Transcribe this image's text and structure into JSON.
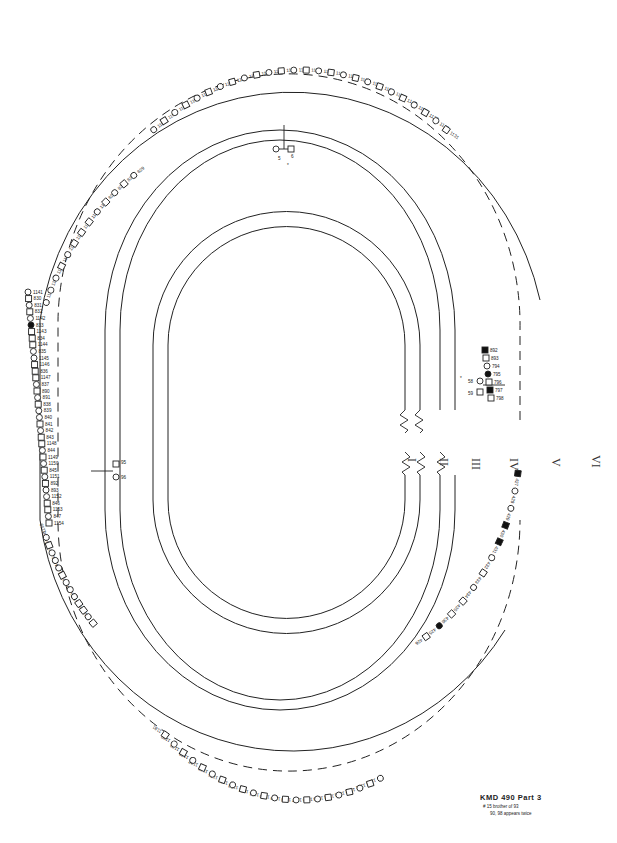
{
  "diagram": {
    "type": "circular-pedigree",
    "title": "KMD 490 Part 3",
    "notes": [
      "# 15 brother of 93",
      "90, 98 appears twice"
    ],
    "generation_labels": [
      "I",
      "II",
      "III",
      "IV",
      "V",
      "VI"
    ],
    "top_couple": {
      "ids": [
        "5",
        "6"
      ],
      "marker": "*"
    },
    "left_couple": {
      "ids": [
        "95",
        "96"
      ]
    },
    "right_couple": {
      "ids": [
        "58",
        "59"
      ],
      "marker": "*"
    },
    "left_side_individuals": [
      {
        "id": "1141",
        "shape": "circle"
      },
      {
        "id": "830",
        "shape": "square"
      },
      {
        "id": "831",
        "shape": "circle"
      },
      {
        "id": "832",
        "shape": "square"
      },
      {
        "id": "1142",
        "shape": "circle"
      },
      {
        "id": "833",
        "shape": "circle",
        "affected": true
      },
      {
        "id": "1143",
        "shape": "square"
      },
      {
        "id": "834",
        "shape": "square"
      },
      {
        "id": "1144",
        "shape": "square"
      },
      {
        "id": "835",
        "shape": "circle"
      },
      {
        "id": "1145",
        "shape": "circle"
      },
      {
        "id": "1146",
        "shape": "square"
      },
      {
        "id": "836",
        "shape": "square"
      },
      {
        "id": "1147",
        "shape": "square"
      },
      {
        "id": "837",
        "shape": "circle"
      },
      {
        "id": "890",
        "shape": "square"
      },
      {
        "id": "891",
        "shape": "circle"
      },
      {
        "id": "838",
        "shape": "square"
      },
      {
        "id": "839",
        "shape": "circle"
      },
      {
        "id": "840",
        "shape": "circle"
      },
      {
        "id": "841",
        "shape": "square"
      },
      {
        "id": "842",
        "shape": "circle"
      },
      {
        "id": "843",
        "shape": "square"
      },
      {
        "id": "1148",
        "shape": "square"
      },
      {
        "id": "844",
        "shape": "circle"
      },
      {
        "id": "1149",
        "shape": "square"
      },
      {
        "id": "1150",
        "shape": "circle"
      },
      {
        "id": "845",
        "shape": "square"
      },
      {
        "id": "1151",
        "shape": "circle"
      },
      {
        "id": "892",
        "shape": "square"
      },
      {
        "id": "893",
        "shape": "circle"
      },
      {
        "id": "1152",
        "shape": "circle"
      },
      {
        "id": "846",
        "shape": "square"
      },
      {
        "id": "1153",
        "shape": "square"
      },
      {
        "id": "847",
        "shape": "circle"
      },
      {
        "id": "1154",
        "shape": "square"
      }
    ],
    "upper_left_individuals": [
      {
        "id": "1132",
        "shape": "circle"
      },
      {
        "id": "1133",
        "shape": "circle"
      },
      {
        "id": "1134",
        "shape": "circle"
      },
      {
        "id": "1135",
        "shape": "square"
      },
      {
        "id": "1136",
        "shape": "circle"
      },
      {
        "id": "1137",
        "shape": "square"
      },
      {
        "id": "1138",
        "shape": "square"
      },
      {
        "id": "1139",
        "shape": "square"
      },
      {
        "id": "1140",
        "shape": "circle"
      },
      {
        "id": "826",
        "shape": "square"
      },
      {
        "id": "827",
        "shape": "circle"
      },
      {
        "id": "828",
        "shape": "square"
      },
      {
        "id": "829",
        "shape": "circle"
      }
    ],
    "lower_left_individuals": [
      {
        "id": "1155",
        "shape": "square"
      },
      {
        "id": "1156",
        "shape": "circle"
      },
      {
        "id": "1157",
        "shape": "square"
      },
      {
        "id": "848",
        "shape": "square"
      },
      {
        "id": "849",
        "shape": "circle"
      },
      {
        "id": "850",
        "shape": "circle"
      },
      {
        "id": "851",
        "shape": "circle"
      },
      {
        "id": "894",
        "shape": "square"
      },
      {
        "id": "895",
        "shape": "circle"
      },
      {
        "id": "852",
        "shape": "circle"
      },
      {
        "id": "853",
        "shape": "circle"
      },
      {
        "id": "1158",
        "shape": "square"
      },
      {
        "id": "1159",
        "shape": "circle"
      }
    ],
    "right_side_individuals": [
      {
        "id": "892",
        "shape": "square",
        "affected": true
      },
      {
        "id": "893",
        "shape": "square"
      },
      {
        "id": "794",
        "shape": "circle"
      },
      {
        "id": "795",
        "shape": "circle",
        "affected": true
      },
      {
        "id": "796",
        "shape": "square"
      },
      {
        "id": "797",
        "shape": "square",
        "affected": true
      },
      {
        "id": "798",
        "shape": "square"
      }
    ],
    "lower_right_individuals": [
      {
        "id": "427",
        "shape": "square",
        "affected": true
      },
      {
        "id": "428",
        "shape": "circle"
      },
      {
        "id": "429",
        "shape": "circle"
      },
      {
        "id": "430",
        "shape": "square",
        "affected": true
      },
      {
        "id": "431",
        "shape": "square",
        "affected": true
      },
      {
        "id": "432",
        "shape": "circle"
      },
      {
        "id": "433",
        "shape": "square"
      },
      {
        "id": "434",
        "shape": "circle"
      },
      {
        "id": "435",
        "shape": "square"
      },
      {
        "id": "436",
        "shape": "square"
      },
      {
        "id": "425",
        "shape": "circle",
        "affected": true
      },
      {
        "id": "426",
        "shape": "square"
      }
    ]
  }
}
